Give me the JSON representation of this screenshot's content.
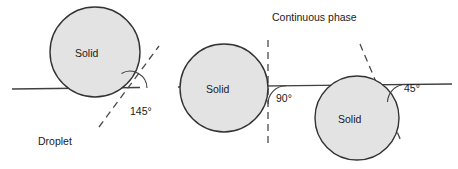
{
  "figure": {
    "background_color": "#ffffff",
    "width": 458,
    "height": 169
  },
  "style": {
    "circle_fill": "#e3e3e3",
    "circle_stroke": "#333333",
    "interface_line_color": "#404040",
    "dashed_line_color": "#4a4a4a",
    "arc_color": "#404040",
    "text_color": "#1a1a1a"
  },
  "captions": [
    {
      "id": "continuous-phase",
      "text": "Continuous phase",
      "x": 272,
      "y": 12
    },
    {
      "id": "droplet",
      "text": "Droplet",
      "x": 38,
      "y": 136
    }
  ],
  "particles": [
    {
      "id": "particle-left",
      "label": "Solid",
      "cx": 95,
      "cy": 52,
      "r": 45,
      "label_x": 75,
      "label_y": 48,
      "angle": {
        "value": "145",
        "unit": "°",
        "text": "145°",
        "label_x": 130,
        "label_y": 106
      },
      "tangent": {
        "x1": 99,
        "y1": 127,
        "x2": 159,
        "y2": 46
      },
      "contact_point": {
        "x": 130,
        "y": 88
      },
      "description": "Solid particle mostly in the continuous phase, contact angle 145 degrees"
    },
    {
      "id": "particle-middle",
      "label": "Solid",
      "cx": 224,
      "cy": 88,
      "r": 44,
      "label_x": 206,
      "label_y": 84,
      "angle": {
        "value": "90",
        "unit": "°",
        "text": "90°",
        "label_x": 276,
        "label_y": 93
      },
      "tangent": {
        "x1": 268,
        "y1": 40,
        "x2": 268,
        "y2": 146
      },
      "contact_point": {
        "x": 268,
        "y": 86
      },
      "description": "Solid particle equally wetted by both phases, contact angle 90 degrees"
    },
    {
      "id": "particle-right",
      "label": "Solid",
      "cx": 357,
      "cy": 118,
      "r": 42,
      "label_x": 338,
      "label_y": 114,
      "angle": {
        "value": "45",
        "unit": "°",
        "text": "45°",
        "label_x": 404,
        "label_y": 83
      },
      "tangent": {
        "x1": 360,
        "y1": 44,
        "x2": 401,
        "y2": 141
      },
      "contact_point": {
        "x": 384,
        "y": 85
      },
      "description": "Solid particle mostly in the droplet phase, contact angle 45 degrees"
    }
  ],
  "interface_line": {
    "id": "interface-line",
    "x1": 12,
    "y1": 89,
    "x2": 452,
    "y2": 84,
    "description": "Droplet / continuous phase interface"
  }
}
